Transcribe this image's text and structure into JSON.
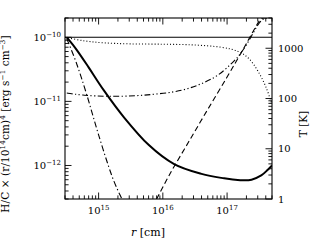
{
  "figure": {
    "xlabel_prefix": "r",
    "xlabel_unit": "[cm]",
    "ylabel_main": "H/C × (r/10",
    "ylabel_exp1": "14",
    "ylabel_mid": "cm)",
    "ylabel_exp2": "4",
    "ylabel_units": "[erg s",
    "ylabel_exp3": "−1",
    "ylabel_units2": " cm",
    "ylabel_exp4": "−3",
    "ylabel_units3": "]",
    "right_axis_label": "T [K]"
  },
  "chart_data": {
    "type": "line",
    "title": "",
    "xlabel": "r [cm]",
    "ylabel": "H/C × (r/10^14 cm)^4 [erg s^-1 cm^-3]",
    "y2label": "T [K]",
    "xscale": "log",
    "yscale": "log",
    "y2scale": "log",
    "xlim": [
      300000000000000.0,
      5e+17
    ],
    "ylim": [
      3e-13,
      2e-10
    ],
    "y2lim": [
      1,
      4000
    ],
    "grid": false,
    "legend": "none",
    "xticks": [
      1000000000000000.0,
      1e+16,
      1e+17
    ],
    "xticklabels": [
      "10^15",
      "10^16",
      "10^17"
    ],
    "yticks": [
      1e-12,
      1e-11,
      1e-10
    ],
    "yticklabels": [
      "10^-12",
      "10^-11",
      "10^-10"
    ],
    "y2ticks": [
      1,
      10,
      100,
      1000
    ],
    "y2ticklabels": [
      "1",
      "10",
      "100",
      "1000"
    ],
    "series": [
      {
        "name": "flat-solid-heating",
        "style": "solid",
        "width": 1.1,
        "x": [
          300000000000000.0,
          5e+17
        ],
        "y": [
          1e-10,
          1e-10
        ]
      },
      {
        "name": "dotted-curve",
        "style": "dotted",
        "width": 1.1,
        "x": [
          300000000000000.0,
          600000000000000.0,
          1200000000000000.0,
          3000000000000000.0,
          1e+16,
          3e+16,
          8e+16,
          1.5e+17,
          2.2e+17,
          3e+17,
          4e+17,
          5e+17
        ],
        "y": [
          1e-10,
          8.8e-11,
          8.2e-11,
          7.9e-11,
          7.8e-11,
          7.6e-11,
          7e-11,
          6e-11,
          4.6e-11,
          3e-11,
          1.7e-11,
          9e-12
        ]
      },
      {
        "name": "thick-solid-net",
        "style": "solid",
        "width": 2.0,
        "x": [
          320000000000000.0,
          450000000000000.0,
          700000000000000.0,
          1200000000000000.0,
          2500000000000000.0,
          6000000000000000.0,
          1.5e+16,
          4e+16,
          9e+16,
          1.6e+17,
          2.4e+17,
          3.4e+17,
          4.3e+17,
          5e+17
        ],
        "y": [
          1e-10,
          6.5e-11,
          3.4e-11,
          1.5e-11,
          5.6e-12,
          2.1e-12,
          1.05e-12,
          7.4e-13,
          6.3e-13,
          5.9e-13,
          6e-13,
          7e-13,
          8.6e-13,
          1e-12
        ]
      },
      {
        "name": "dash-dot-decline",
        "style": "dashdot",
        "width": 1.1,
        "x": [
          320000000000000.0,
          450000000000000.0,
          650000000000000.0,
          1000000000000000.0,
          1600000000000000.0,
          2300000000000000.0
        ],
        "y": [
          9.5e-11,
          4e-11,
          1.3e-11,
          3e-12,
          7e-13,
          3e-13
        ]
      },
      {
        "name": "dash-dot-dot-rise",
        "style": "dashdotdot",
        "width": 1.1,
        "x": [
          320000000000000.0,
          600000000000000.0,
          1500000000000000.0,
          5000000000000000.0,
          2e+16,
          6e+16,
          1.2e+17,
          1.8e+17,
          2.4e+17,
          3e+17,
          3.6e+17,
          4.2e+17
        ],
        "y": [
          1.35e-11,
          1.25e-11,
          1.2e-11,
          1.25e-11,
          1.5e-11,
          2.3e-11,
          4e-11,
          6.5e-11,
          1.05e-10,
          1.55e-10,
          1.9e-10,
          2e-10
        ]
      },
      {
        "name": "dashed-rise",
        "style": "dashed",
        "width": 1.1,
        "x": [
          8000000000000000.0,
          1.3e+16,
          2.5e+16,
          5e+16,
          1e+17,
          1.7e+17,
          2.5e+17,
          3.3e+17,
          4e+17
        ],
        "y": [
          3e-13,
          7.5e-13,
          2.3e-12,
          7.5e-12,
          2.4e-11,
          6e-11,
          1.2e-10,
          1.9e-10,
          2e-10
        ]
      }
    ]
  }
}
